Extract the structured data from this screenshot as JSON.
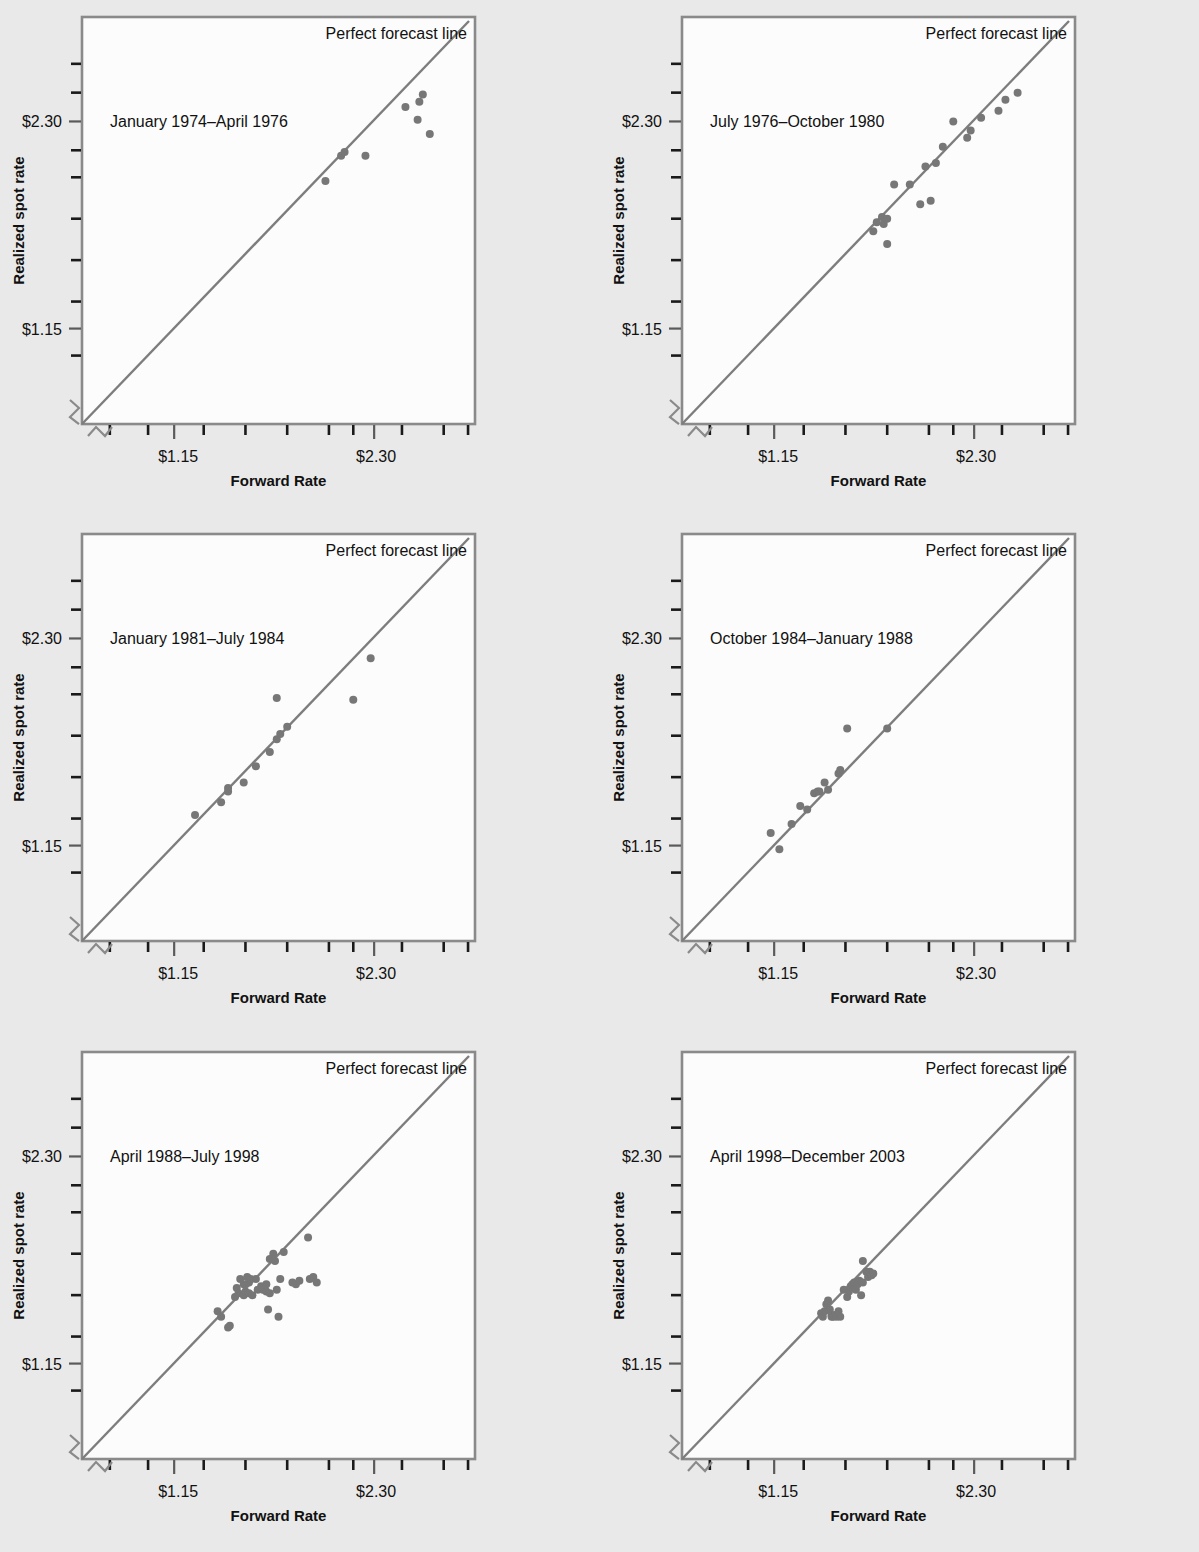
{
  "figure": {
    "background_color": "#e9e9e9",
    "plot_background_color": "#fcfcfc",
    "line_color": "#7d7d7d",
    "dot_color": "#777777",
    "axis_color": "#8a8a8a"
  },
  "common": {
    "xlabel": "Forward Rate",
    "ylabel": "Realized spot rate",
    "line_label": "Perfect forecast line",
    "x_tick_labels": [
      "$1.15",
      "$2.30"
    ],
    "y_tick_labels": [
      "$2.30",
      "$1.15"
    ],
    "axis_break_marker": "zigzag-break-icon"
  },
  "chart_data": [
    {
      "type": "scatter",
      "title": "January 1974–April 1976",
      "xlabel": "Forward Rate",
      "ylabel": "Realized spot rate",
      "xlim": [
        0.55,
        2.85
      ],
      "ylim": [
        0.55,
        2.85
      ],
      "xticks": [
        0.75,
        1.0,
        1.15,
        1.3,
        1.55,
        1.8,
        2.05,
        2.2,
        2.3,
        2.45,
        2.7
      ],
      "yticks": [
        1.0,
        1.15,
        1.3,
        1.55,
        1.8,
        2.05,
        2.15,
        2.3,
        2.45,
        2.6
      ],
      "xticklabels": {
        "1.15": "$1.15",
        "2.30": "$2.30"
      },
      "yticklabels": {
        "1.15": "$1.15",
        "2.30": "$2.30"
      },
      "grid": false,
      "reference_line": {
        "label": "Perfect forecast line",
        "slope": 1,
        "intercept": 0
      },
      "points": [
        [
          2.02,
          1.97
        ],
        [
          2.11,
          2.11
        ],
        [
          2.13,
          2.13
        ],
        [
          2.25,
          2.11
        ],
        [
          2.48,
          2.38
        ],
        [
          2.55,
          2.31
        ],
        [
          2.56,
          2.41
        ],
        [
          2.58,
          2.45
        ],
        [
          2.62,
          2.23
        ]
      ]
    },
    {
      "type": "scatter",
      "title": "July 1976–October 1980",
      "xlabel": "Forward Rate",
      "ylabel": "Realized spot rate",
      "xlim": [
        0.55,
        2.85
      ],
      "ylim": [
        0.55,
        2.85
      ],
      "grid": false,
      "reference_line": {
        "label": "Perfect forecast line",
        "slope": 1,
        "intercept": 0
      },
      "points": [
        [
          1.72,
          1.69
        ],
        [
          1.74,
          1.74
        ],
        [
          1.77,
          1.77
        ],
        [
          1.78,
          1.73
        ],
        [
          1.8,
          1.76
        ],
        [
          1.8,
          1.62
        ],
        [
          1.84,
          1.95
        ],
        [
          1.93,
          1.95
        ],
        [
          1.99,
          1.84
        ],
        [
          2.02,
          2.05
        ],
        [
          2.05,
          1.86
        ],
        [
          2.08,
          2.07
        ],
        [
          2.12,
          2.16
        ],
        [
          2.18,
          2.3
        ],
        [
          2.26,
          2.21
        ],
        [
          2.28,
          2.25
        ],
        [
          2.34,
          2.32
        ],
        [
          2.44,
          2.36
        ],
        [
          2.48,
          2.42
        ],
        [
          2.55,
          2.46
        ]
      ]
    },
    {
      "type": "scatter",
      "title": "January 1981–July 1984",
      "xlabel": "Forward Rate",
      "ylabel": "Realized spot rate",
      "xlim": [
        0.55,
        2.85
      ],
      "ylim": [
        0.55,
        2.85
      ],
      "grid": false,
      "reference_line": {
        "label": "Perfect forecast line",
        "slope": 1,
        "intercept": 0
      },
      "points": [
        [
          1.27,
          1.32
        ],
        [
          1.42,
          1.39
        ],
        [
          1.46,
          1.47
        ],
        [
          1.46,
          1.45
        ],
        [
          1.55,
          1.5
        ],
        [
          1.62,
          1.59
        ],
        [
          1.7,
          1.67
        ],
        [
          1.74,
          1.74
        ],
        [
          1.76,
          1.77
        ],
        [
          1.8,
          1.81
        ],
        [
          1.74,
          1.97
        ],
        [
          2.18,
          1.96
        ],
        [
          2.28,
          2.19
        ]
      ]
    },
    {
      "type": "scatter",
      "title": "October 1984–January 1988",
      "xlabel": "Forward Rate",
      "ylabel": "Realized spot rate",
      "xlim": [
        0.55,
        2.85
      ],
      "ylim": [
        0.55,
        2.85
      ],
      "grid": false,
      "reference_line": {
        "label": "Perfect forecast line",
        "slope": 1,
        "intercept": 0
      },
      "points": [
        [
          1.13,
          1.22
        ],
        [
          1.18,
          1.13
        ],
        [
          1.25,
          1.27
        ],
        [
          1.3,
          1.37
        ],
        [
          1.34,
          1.35
        ],
        [
          1.38,
          1.44
        ],
        [
          1.4,
          1.45
        ],
        [
          1.41,
          1.45
        ],
        [
          1.44,
          1.5
        ],
        [
          1.46,
          1.46
        ],
        [
          1.52,
          1.55
        ],
        [
          1.53,
          1.57
        ],
        [
          1.57,
          1.8
        ],
        [
          1.8,
          1.8
        ]
      ]
    },
    {
      "type": "scatter",
      "title": "April 1988–July 1998",
      "xlabel": "Forward Rate",
      "ylabel": "Realized spot rate",
      "xlim": [
        0.55,
        2.85
      ],
      "ylim": [
        0.55,
        2.85
      ],
      "grid": false,
      "reference_line": {
        "label": "Perfect forecast line",
        "slope": 1,
        "intercept": 0
      },
      "points": [
        [
          1.4,
          1.44
        ],
        [
          1.42,
          1.41
        ],
        [
          1.46,
          1.35
        ],
        [
          1.47,
          1.36
        ],
        [
          1.5,
          1.52
        ],
        [
          1.51,
          1.57
        ],
        [
          1.52,
          1.54
        ],
        [
          1.53,
          1.62
        ],
        [
          1.55,
          1.59
        ],
        [
          1.55,
          1.53
        ],
        [
          1.56,
          1.55
        ],
        [
          1.57,
          1.63
        ],
        [
          1.58,
          1.6
        ],
        [
          1.58,
          1.54
        ],
        [
          1.59,
          1.62
        ],
        [
          1.6,
          1.53
        ],
        [
          1.62,
          1.62
        ],
        [
          1.63,
          1.56
        ],
        [
          1.65,
          1.58
        ],
        [
          1.66,
          1.57
        ],
        [
          1.66,
          1.56
        ],
        [
          1.67,
          1.57
        ],
        [
          1.68,
          1.55
        ],
        [
          1.68,
          1.59
        ],
        [
          1.69,
          1.45
        ],
        [
          1.7,
          1.54
        ],
        [
          1.7,
          1.73
        ],
        [
          1.72,
          1.76
        ],
        [
          1.73,
          1.72
        ],
        [
          1.74,
          1.56
        ],
        [
          1.75,
          1.41
        ],
        [
          1.76,
          1.62
        ],
        [
          1.78,
          1.77
        ],
        [
          1.83,
          1.6
        ],
        [
          1.85,
          1.59
        ],
        [
          1.87,
          1.61
        ],
        [
          1.92,
          1.85
        ],
        [
          1.93,
          1.62
        ],
        [
          1.95,
          1.63
        ],
        [
          1.97,
          1.6
        ]
      ]
    },
    {
      "type": "scatter",
      "title": "April 1998–December 2003",
      "xlabel": "Forward Rate",
      "ylabel": "Realized spot rate",
      "xlim": [
        0.55,
        2.85
      ],
      "ylim": [
        0.55,
        2.85
      ],
      "grid": false,
      "reference_line": {
        "label": "Perfect forecast line",
        "slope": 1,
        "intercept": 0
      },
      "points": [
        [
          1.42,
          1.43
        ],
        [
          1.43,
          1.41
        ],
        [
          1.44,
          1.44
        ],
        [
          1.45,
          1.48
        ],
        [
          1.46,
          1.5
        ],
        [
          1.47,
          1.45
        ],
        [
          1.48,
          1.42
        ],
        [
          1.48,
          1.41
        ],
        [
          1.49,
          1.41
        ],
        [
          1.5,
          1.42
        ],
        [
          1.51,
          1.41
        ],
        [
          1.52,
          1.44
        ],
        [
          1.53,
          1.41
        ],
        [
          1.55,
          1.56
        ],
        [
          1.57,
          1.52
        ],
        [
          1.58,
          1.55
        ],
        [
          1.59,
          1.58
        ],
        [
          1.6,
          1.59
        ],
        [
          1.61,
          1.6
        ],
        [
          1.62,
          1.56
        ],
        [
          1.63,
          1.59
        ],
        [
          1.64,
          1.61
        ],
        [
          1.65,
          1.53
        ],
        [
          1.66,
          1.6
        ],
        [
          1.66,
          1.72
        ],
        [
          1.68,
          1.66
        ],
        [
          1.69,
          1.63
        ],
        [
          1.7,
          1.66
        ],
        [
          1.71,
          1.64
        ],
        [
          1.72,
          1.65
        ]
      ]
    }
  ]
}
